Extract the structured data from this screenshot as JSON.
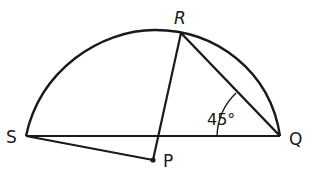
{
  "diagram": {
    "type": "geometry",
    "points": {
      "S": {
        "label": "S",
        "x": 26,
        "y": 136
      },
      "Q": {
        "label": "Q",
        "x": 280,
        "y": 136
      },
      "R": {
        "label": "R",
        "x": 181,
        "y": 33
      },
      "P": {
        "label": "P",
        "x": 153,
        "y": 160
      }
    },
    "segments": [
      "SQ",
      "RQ",
      "RP",
      "SP"
    ],
    "arc": "S-R-Q",
    "angle": {
      "vertex": "Q",
      "between": [
        "R",
        "S"
      ],
      "label": "45°"
    },
    "colors": {
      "stroke": "#1a1a1a",
      "background": "#ffffff"
    }
  }
}
